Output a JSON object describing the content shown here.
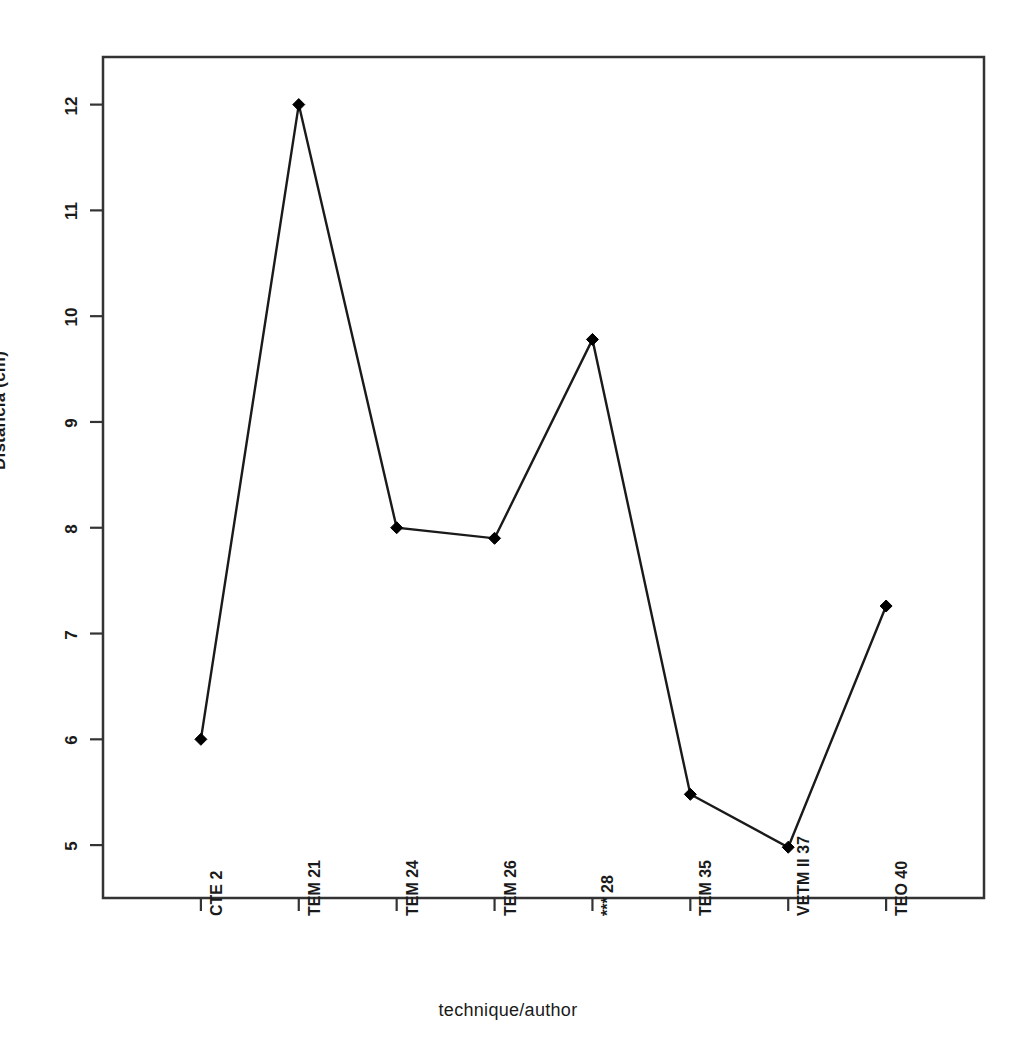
{
  "chart_data": {
    "type": "line",
    "title": "",
    "xlabel": "technique/author",
    "ylabel": "Distância (cm)",
    "categories": [
      "CTE 2",
      "TEM 21",
      "TEM 24",
      "TEM 26",
      "*** 28",
      "TEM 35",
      "VETM II 37",
      "TEO 40"
    ],
    "values": [
      6.0,
      12.0,
      8.0,
      7.9,
      9.78,
      5.48,
      4.98,
      7.26
    ],
    "series": [
      {
        "name": "Distância (cm)",
        "values": [
          6.0,
          12.0,
          8.0,
          7.9,
          9.78,
          5.48,
          4.98,
          7.26
        ]
      }
    ],
    "ylim": [
      4.5,
      12.45
    ],
    "xlim": [
      0,
      9
    ],
    "yticks": [
      5,
      6,
      7,
      8,
      9,
      10,
      11,
      12
    ],
    "ytick_labels": [
      "5",
      "6",
      "7",
      "8",
      "9",
      "10",
      "11",
      "12"
    ],
    "xtick_labels": [
      "CTE 2",
      "TEM 21",
      "TEM 24",
      "TEM 26",
      "*** 28",
      "TEM 35",
      "VETM II 37",
      "TEO 40"
    ],
    "grid": false,
    "legend": false,
    "legend_position": "none",
    "marker": "diamond",
    "line_color": "#1a1a1a",
    "marker_color": "#000000",
    "frame_color": "#333333",
    "background": "#ffffff"
  },
  "axes": {
    "y_title": "Distância (cm)",
    "x_title": "technique/author"
  }
}
